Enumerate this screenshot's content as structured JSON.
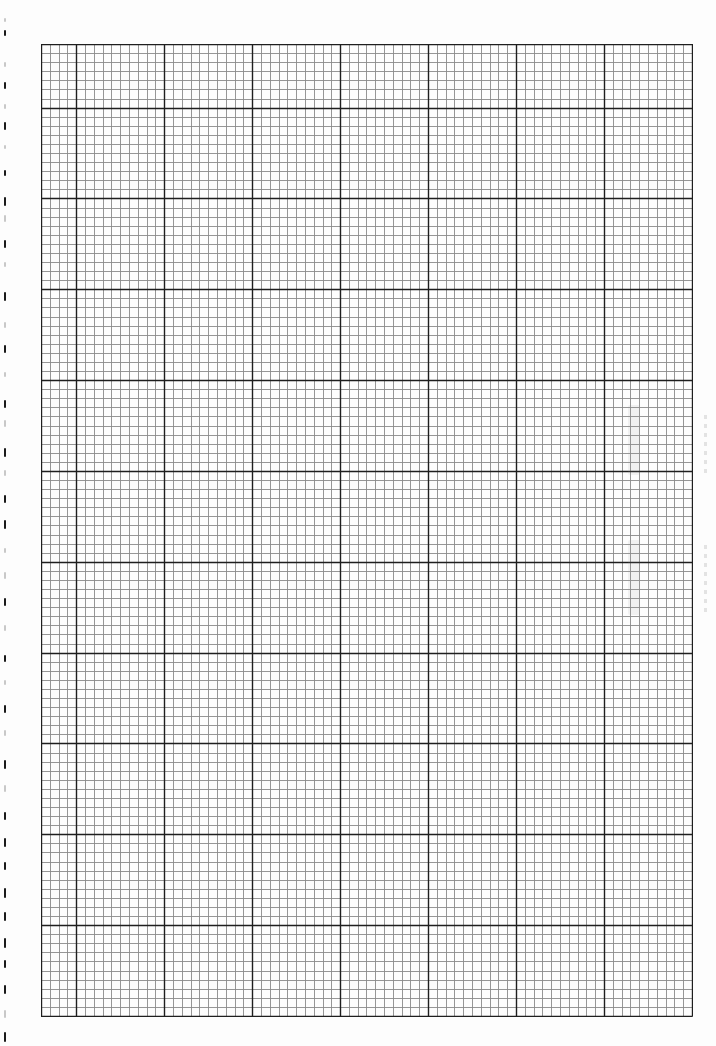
{
  "page": {
    "type": "graph-paper-sheet",
    "background": "#fdfdfd",
    "width": 716,
    "height": 1046
  },
  "grid": {
    "left": 41,
    "top": 44,
    "right": 692,
    "bottom": 1016,
    "columns": 74,
    "rows": 107,
    "cell_width": 8.797,
    "cell_height": 9.084,
    "major_every": 10,
    "first_major_column_offset": 4,
    "first_major_row_offset": 7,
    "minor_line_color": "#8a8a8a",
    "major_line_color": "#1e1e1e",
    "border_color": "#1e1e1e",
    "minor_line_width": 0.9,
    "major_line_width": 1.4
  },
  "perforations": {
    "x": 4,
    "marks_y": [
      18,
      30,
      62,
      82,
      104,
      122,
      145,
      170,
      197,
      215,
      240,
      262,
      292,
      322,
      345,
      372,
      400,
      420,
      448,
      470,
      495,
      520,
      548,
      572,
      598,
      625,
      655,
      680,
      705,
      730,
      760,
      785,
      812,
      838,
      862,
      888,
      912,
      938,
      960,
      985,
      1010,
      1032
    ],
    "marks_h": [
      4,
      6,
      5,
      7,
      5,
      8,
      4,
      6,
      9,
      7,
      8,
      5,
      9,
      6,
      8,
      5,
      8,
      7,
      9,
      6,
      8,
      9,
      5,
      7,
      8,
      6,
      7,
      5,
      8,
      6,
      9,
      7,
      8,
      9,
      8,
      10,
      9,
      10,
      8,
      9,
      8,
      10
    ],
    "marks_dark": [
      false,
      true,
      false,
      true,
      false,
      true,
      false,
      true,
      true,
      false,
      true,
      false,
      true,
      false,
      true,
      false,
      true,
      false,
      true,
      false,
      true,
      true,
      false,
      false,
      true,
      false,
      true,
      false,
      true,
      false,
      true,
      false,
      true,
      true,
      true,
      true,
      true,
      true,
      true,
      true,
      false,
      true
    ],
    "dark_color": "#1a1a1a",
    "light_color": "#c8c8c8"
  },
  "artifacts": {
    "bleed_regions": [
      {
        "x": 628,
        "y": 405,
        "w": 12,
        "h": 70
      },
      {
        "x": 628,
        "y": 540,
        "w": 12,
        "h": 75
      }
    ],
    "bleed_text_columns": [
      {
        "x": 704,
        "y": 415,
        "h": 60
      },
      {
        "x": 704,
        "y": 545,
        "h": 70
      }
    ]
  }
}
